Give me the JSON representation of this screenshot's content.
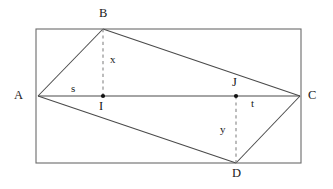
{
  "figure": {
    "type": "geometry-diagram",
    "width": 333,
    "height": 189,
    "background_color": "#ffffff",
    "stroke_color": "#4a4a4a",
    "dash_color": "#777777",
    "label_color": "#1a1a1a"
  },
  "rectangle": {
    "name": "bounding-rectangle",
    "x": 36,
    "y": 29,
    "width": 265,
    "height": 134
  },
  "points": [
    {
      "id": "A",
      "label": "A",
      "x": 38,
      "y": 96,
      "dot": false,
      "label_x": 14,
      "label_y": 89
    },
    {
      "id": "B",
      "label": "B",
      "x": 103,
      "y": 29,
      "dot": false,
      "label_x": 99,
      "label_y": 7
    },
    {
      "id": "C",
      "label": "C",
      "x": 300,
      "y": 96,
      "dot": false,
      "label_x": 308,
      "label_y": 89
    },
    {
      "id": "D",
      "label": "D",
      "x": 236,
      "y": 163,
      "dot": false,
      "label_x": 232,
      "label_y": 167
    },
    {
      "id": "I",
      "label": "I",
      "x": 103,
      "y": 96,
      "dot": true,
      "label_x": 99,
      "label_y": 100
    },
    {
      "id": "J",
      "label": "J",
      "x": 236,
      "y": 96,
      "dot": true,
      "label_x": 232,
      "label_y": 76
    }
  ],
  "solid_segments": [
    {
      "id": "AB",
      "from": "A",
      "to": "B",
      "x1": 38,
      "y1": 96,
      "x2": 103,
      "y2": 29
    },
    {
      "id": "BC",
      "from": "B",
      "to": "C",
      "x1": 103,
      "y1": 29,
      "x2": 300,
      "y2": 96
    },
    {
      "id": "AC",
      "from": "A",
      "to": "C",
      "x1": 38,
      "y1": 96,
      "x2": 300,
      "y2": 96
    },
    {
      "id": "AD",
      "from": "A",
      "to": "D",
      "x1": 38,
      "y1": 96,
      "x2": 236,
      "y2": 163
    },
    {
      "id": "DC",
      "from": "D",
      "to": "C",
      "x1": 236,
      "y1": 163,
      "x2": 300,
      "y2": 96
    }
  ],
  "dashed_segments": [
    {
      "id": "BI",
      "from": "B",
      "to": "I",
      "x1": 103,
      "y1": 29,
      "x2": 103,
      "y2": 96
    },
    {
      "id": "JD",
      "from": "J",
      "to": "D",
      "x1": 236,
      "y1": 96,
      "x2": 236,
      "y2": 163
    }
  ],
  "measure_labels": [
    {
      "id": "x",
      "label": "x",
      "x": 110,
      "y": 54,
      "describes": "altitude from B to AC (segment BI)"
    },
    {
      "id": "y",
      "label": "y",
      "x": 220,
      "y": 124,
      "describes": "altitude from D to AC (segment JD)"
    },
    {
      "id": "s",
      "label": "s",
      "x": 71,
      "y": 83,
      "describes": "segment AI along AC"
    },
    {
      "id": "t",
      "label": "t",
      "x": 251,
      "y": 98,
      "describes": "segment JC along AC"
    }
  ]
}
